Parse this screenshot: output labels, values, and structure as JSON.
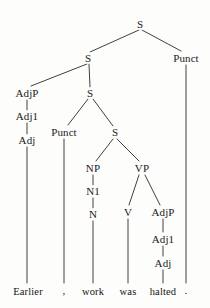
{
  "figure": {
    "kind": "syntax-tree",
    "sentence": "Earlier , work was halted .",
    "ink_color": "#1b1b1b",
    "background_color": "#fdfdfc"
  },
  "nodes": {
    "s_root": {
      "label": "S",
      "x": 140,
      "y": 24
    },
    "s_level2": {
      "label": "S",
      "x": 88,
      "y": 58
    },
    "punct_top": {
      "label": "Punct",
      "x": 186,
      "y": 58
    },
    "adjp_left": {
      "label": "AdjP",
      "x": 27,
      "y": 93
    },
    "s_level3": {
      "label": "S",
      "x": 90,
      "y": 93
    },
    "adj1_left": {
      "label": "Adj1",
      "x": 27,
      "y": 116
    },
    "punct_inner": {
      "label": "Punct",
      "x": 64,
      "y": 132
    },
    "s_level4": {
      "label": "S",
      "x": 115,
      "y": 132
    },
    "adj_left": {
      "label": "Adj",
      "x": 27,
      "y": 140
    },
    "np": {
      "label": "NP",
      "x": 93,
      "y": 168
    },
    "vp": {
      "label": "VP",
      "x": 142,
      "y": 168
    },
    "n1": {
      "label": "N1",
      "x": 93,
      "y": 191
    },
    "v": {
      "label": "V",
      "x": 128,
      "y": 212
    },
    "adjp_right": {
      "label": "AdjP",
      "x": 163,
      "y": 212
    },
    "n": {
      "label": "N",
      "x": 93,
      "y": 214
    },
    "adj1_right": {
      "label": "Adj1",
      "x": 163,
      "y": 239
    },
    "adj_right": {
      "label": "Adj",
      "x": 163,
      "y": 263
    }
  },
  "leaves": [
    {
      "label": "Earlier",
      "x": 28,
      "y": 291
    },
    {
      "label": ",",
      "x": 64,
      "y": 290
    },
    {
      "label": "work",
      "x": 93,
      "y": 291
    },
    {
      "label": "was",
      "x": 128,
      "y": 291
    },
    {
      "label": "halted",
      "x": 163,
      "y": 291
    },
    {
      "label": ".",
      "x": 186,
      "y": 290
    }
  ],
  "edges": [
    {
      "from": "s_root",
      "to": "s_level2"
    },
    {
      "from": "s_root",
      "to": "punct_top"
    },
    {
      "from": "s_level2",
      "to": "adjp_left"
    },
    {
      "from": "s_level2",
      "to": "s_level3"
    },
    {
      "from": "s_level3",
      "to": "punct_inner"
    },
    {
      "from": "s_level3",
      "to": "s_level4"
    },
    {
      "from": "adjp_left",
      "to": "adj1_left"
    },
    {
      "from": "adj1_left",
      "to": "adj_left"
    },
    {
      "from": "s_level4",
      "to": "np"
    },
    {
      "from": "s_level4",
      "to": "vp"
    },
    {
      "from": "np",
      "to": "n1"
    },
    {
      "from": "n1",
      "to": "n"
    },
    {
      "from": "vp",
      "to": "v"
    },
    {
      "from": "vp",
      "to": "adjp_right"
    },
    {
      "from": "adjp_right",
      "to": "adj1_right"
    },
    {
      "from": "adj1_right",
      "to": "adj_right"
    },
    {
      "from": "adj_left",
      "to": "leaf_earlier"
    },
    {
      "from": "punct_inner",
      "to": "leaf_comma"
    },
    {
      "from": "n",
      "to": "leaf_work"
    },
    {
      "from": "v",
      "to": "leaf_was"
    },
    {
      "from": "adj_right",
      "to": "leaf_halted"
    },
    {
      "from": "punct_top",
      "to": "leaf_period"
    }
  ]
}
